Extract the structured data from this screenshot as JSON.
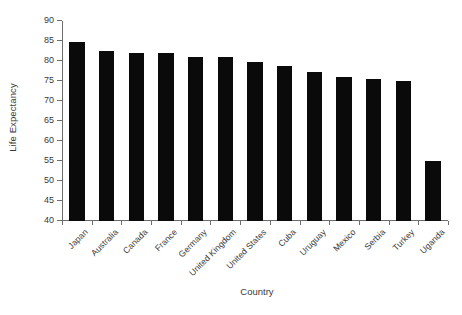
{
  "chart_data": {
    "type": "bar",
    "title": "",
    "subtitle": "",
    "xlabel": "Country",
    "ylabel": "Life Expectancy",
    "categories": [
      "Japan",
      "Australia",
      "Canada",
      "France",
      "Germany",
      "United Kingdom",
      "United States",
      "Cuba",
      "Uruguay",
      "Mexico",
      "Serbia",
      "Turkey",
      "Uganda"
    ],
    "values": [
      84.8,
      82.4,
      82.1,
      82.1,
      80.9,
      80.9,
      79.8,
      78.8,
      77.2,
      75.9,
      75.6,
      75.1,
      54.9
    ],
    "ylim": [
      40,
      90
    ],
    "yticks": [
      40,
      45,
      50,
      55,
      60,
      65,
      70,
      75,
      80,
      85,
      90
    ],
    "ytick_labels": [
      "40",
      "45",
      "50",
      "55",
      "60",
      "65",
      "70",
      "75",
      "80",
      "85",
      "90"
    ],
    "grid": false,
    "legend": false,
    "legend_position": "none",
    "bar_color": "#0a0a0a",
    "axis_color": "#6d6d6d",
    "text_color": "#3a3a3a",
    "background_color": "#ffffff",
    "xtick_label_rotation": -45,
    "annotations": []
  }
}
